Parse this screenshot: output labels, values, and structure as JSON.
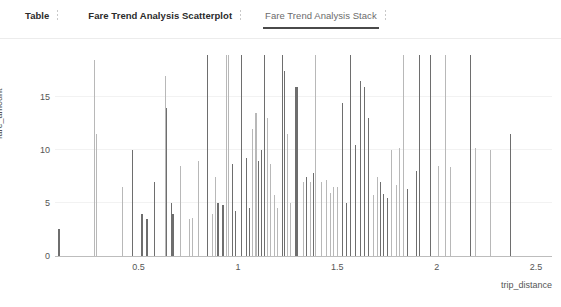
{
  "tabs": [
    {
      "label": "Table",
      "active": false,
      "style": "bold"
    },
    {
      "label": "Fare Trend Analysis Scatterplot",
      "active": false,
      "style": "bold"
    },
    {
      "label": "Fare Trend Analysis Stack",
      "active": true,
      "style": "muted"
    }
  ],
  "colors": {
    "active_underline": "#4a4a4a",
    "axis": "#bdbdbd",
    "grid": "#f2f2f2",
    "tick_text": "#555555",
    "bar_dark": "#6e6e6e",
    "bar_light": "#b8b8b8"
  },
  "chart_data": {
    "type": "bar",
    "title": "",
    "xlabel": "trip_distance",
    "ylabel": "fare_amount",
    "xlim": [
      0.08,
      2.58
    ],
    "ylim": [
      0,
      19
    ],
    "xticks": [
      "0.5",
      "1",
      "1.5",
      "2",
      "2.5"
    ],
    "xtick_values": [
      0.5,
      1,
      1.5,
      2,
      2.5
    ],
    "yticks": [
      "0",
      "5",
      "10",
      "15"
    ],
    "ytick_values": [
      0,
      5,
      10,
      15
    ],
    "grid": "horizontal",
    "legend": "none",
    "series": [
      {
        "name": "fare_amount",
        "points": [
          {
            "x": 0.1,
            "y": 2.6,
            "shade": "dark",
            "w": 2
          },
          {
            "x": 0.28,
            "y": 18.5,
            "shade": "light",
            "w": 1
          },
          {
            "x": 0.29,
            "y": 11.5,
            "shade": "light",
            "w": 1
          },
          {
            "x": 0.42,
            "y": 6.5,
            "shade": "light",
            "w": 1
          },
          {
            "x": 0.47,
            "y": 10.0,
            "shade": "dark",
            "w": 1
          },
          {
            "x": 0.52,
            "y": 4.0,
            "shade": "dark",
            "w": 2
          },
          {
            "x": 0.545,
            "y": 3.5,
            "shade": "dark",
            "w": 2
          },
          {
            "x": 0.58,
            "y": 7.0,
            "shade": "dark",
            "w": 1
          },
          {
            "x": 0.635,
            "y": 17.0,
            "shade": "light",
            "w": 1
          },
          {
            "x": 0.64,
            "y": 14.0,
            "shade": "dark",
            "w": 1
          },
          {
            "x": 0.665,
            "y": 5.0,
            "shade": "dark",
            "w": 1
          },
          {
            "x": 0.675,
            "y": 4.0,
            "shade": "dark",
            "w": 2
          },
          {
            "x": 0.71,
            "y": 8.5,
            "shade": "light",
            "w": 1
          },
          {
            "x": 0.755,
            "y": 3.5,
            "shade": "light",
            "w": 1
          },
          {
            "x": 0.77,
            "y": 3.6,
            "shade": "light",
            "w": 1
          },
          {
            "x": 0.8,
            "y": 9.0,
            "shade": "light",
            "w": 1
          },
          {
            "x": 0.845,
            "y": 19.0,
            "shade": "dark",
            "w": 1
          },
          {
            "x": 0.87,
            "y": 4.0,
            "shade": "light",
            "w": 1
          },
          {
            "x": 0.885,
            "y": 7.5,
            "shade": "light",
            "w": 1
          },
          {
            "x": 0.9,
            "y": 5.0,
            "shade": "dark",
            "w": 2
          },
          {
            "x": 0.925,
            "y": 4.8,
            "shade": "dark",
            "w": 2
          },
          {
            "x": 0.945,
            "y": 19.0,
            "shade": "light",
            "w": 1
          },
          {
            "x": 0.955,
            "y": 19.0,
            "shade": "light",
            "w": 1
          },
          {
            "x": 0.975,
            "y": 8.7,
            "shade": "dark",
            "w": 1
          },
          {
            "x": 0.99,
            "y": 4.3,
            "shade": "dark",
            "w": 1
          },
          {
            "x": 1.02,
            "y": 19.0,
            "shade": "dark",
            "w": 1
          },
          {
            "x": 1.045,
            "y": 9.3,
            "shade": "dark",
            "w": 1
          },
          {
            "x": 1.06,
            "y": 4.5,
            "shade": "dark",
            "w": 1
          },
          {
            "x": 1.075,
            "y": 12.0,
            "shade": "light",
            "w": 1
          },
          {
            "x": 1.09,
            "y": 13.5,
            "shade": "light",
            "w": 2
          },
          {
            "x": 1.105,
            "y": 9.0,
            "shade": "dark",
            "w": 1
          },
          {
            "x": 1.12,
            "y": 10.0,
            "shade": "dark",
            "w": 1
          },
          {
            "x": 1.135,
            "y": 19.0,
            "shade": "dark",
            "w": 1
          },
          {
            "x": 1.15,
            "y": 13.0,
            "shade": "light",
            "w": 1
          },
          {
            "x": 1.165,
            "y": 8.7,
            "shade": "light",
            "w": 1
          },
          {
            "x": 1.185,
            "y": 5.8,
            "shade": "light",
            "w": 1
          },
          {
            "x": 1.2,
            "y": 4.5,
            "shade": "light",
            "w": 1
          },
          {
            "x": 1.225,
            "y": 19.0,
            "shade": "dark",
            "w": 1
          },
          {
            "x": 1.235,
            "y": 17.5,
            "shade": "dark",
            "w": 1
          },
          {
            "x": 1.25,
            "y": 11.5,
            "shade": "light",
            "w": 1
          },
          {
            "x": 1.265,
            "y": 5.0,
            "shade": "light",
            "w": 1
          },
          {
            "x": 1.295,
            "y": 16.0,
            "shade": "dark",
            "w": 3
          },
          {
            "x": 1.33,
            "y": 7.0,
            "shade": "light",
            "w": 1
          },
          {
            "x": 1.345,
            "y": 7.5,
            "shade": "dark",
            "w": 1
          },
          {
            "x": 1.365,
            "y": 7.0,
            "shade": "light",
            "w": 1
          },
          {
            "x": 1.38,
            "y": 7.8,
            "shade": "dark",
            "w": 1
          },
          {
            "x": 1.39,
            "y": 19.0,
            "shade": "light",
            "w": 1
          },
          {
            "x": 1.42,
            "y": 7.0,
            "shade": "light",
            "w": 1
          },
          {
            "x": 1.445,
            "y": 7.2,
            "shade": "light",
            "w": 1
          },
          {
            "x": 1.465,
            "y": 6.0,
            "shade": "light",
            "w": 1
          },
          {
            "x": 1.48,
            "y": 6.5,
            "shade": "light",
            "w": 1
          },
          {
            "x": 1.5,
            "y": 6.5,
            "shade": "light",
            "w": 1
          },
          {
            "x": 1.525,
            "y": 14.5,
            "shade": "dark",
            "w": 1
          },
          {
            "x": 1.545,
            "y": 5.0,
            "shade": "dark",
            "w": 1
          },
          {
            "x": 1.565,
            "y": 19.0,
            "shade": "dark",
            "w": 1
          },
          {
            "x": 1.59,
            "y": 10.5,
            "shade": "dark",
            "w": 1
          },
          {
            "x": 1.615,
            "y": 16.5,
            "shade": "dark",
            "w": 1
          },
          {
            "x": 1.635,
            "y": 16.0,
            "shade": "dark",
            "w": 1
          },
          {
            "x": 1.655,
            "y": 13.0,
            "shade": "dark",
            "w": 1
          },
          {
            "x": 1.68,
            "y": 5.8,
            "shade": "light",
            "w": 1
          },
          {
            "x": 1.7,
            "y": 7.5,
            "shade": "light",
            "w": 1
          },
          {
            "x": 1.715,
            "y": 7.0,
            "shade": "dark",
            "w": 1
          },
          {
            "x": 1.73,
            "y": 5.9,
            "shade": "dark",
            "w": 1
          },
          {
            "x": 1.755,
            "y": 5.5,
            "shade": "dark",
            "w": 1
          },
          {
            "x": 1.775,
            "y": 10.0,
            "shade": "light",
            "w": 1
          },
          {
            "x": 1.8,
            "y": 6.7,
            "shade": "light",
            "w": 1
          },
          {
            "x": 1.815,
            "y": 10.2,
            "shade": "light",
            "w": 1
          },
          {
            "x": 1.835,
            "y": 19.0,
            "shade": "light",
            "w": 1
          },
          {
            "x": 1.855,
            "y": 6.3,
            "shade": "dark",
            "w": 1
          },
          {
            "x": 1.9,
            "y": 8.0,
            "shade": "dark",
            "w": 1
          },
          {
            "x": 1.915,
            "y": 19.0,
            "shade": "dark",
            "w": 1
          },
          {
            "x": 1.97,
            "y": 19.0,
            "shade": "dark",
            "w": 1
          },
          {
            "x": 2.01,
            "y": 8.5,
            "shade": "light",
            "w": 1
          },
          {
            "x": 2.045,
            "y": 19.0,
            "shade": "light",
            "w": 1
          },
          {
            "x": 2.07,
            "y": 8.4,
            "shade": "light",
            "w": 1
          },
          {
            "x": 2.17,
            "y": 19.0,
            "shade": "dark",
            "w": 1
          },
          {
            "x": 2.195,
            "y": 10.2,
            "shade": "light",
            "w": 1
          },
          {
            "x": 2.27,
            "y": 10.0,
            "shade": "light",
            "w": 1
          },
          {
            "x": 2.37,
            "y": 11.5,
            "shade": "dark",
            "w": 1
          }
        ]
      }
    ]
  }
}
